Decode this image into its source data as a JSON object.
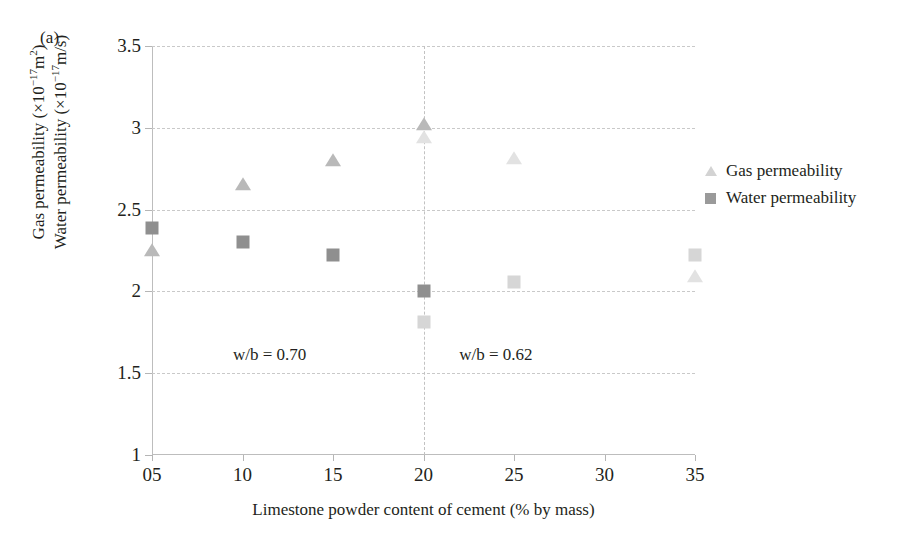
{
  "figure": {
    "panel_label": "(a)"
  },
  "axes": {
    "y_title_line1_prefix": "Gas permeability (×10",
    "y_title_line1_exp": "−17",
    "y_title_line1_suffix": "m",
    "y_title_line1_unit_exp": "2",
    "y_title_line1_close": ")",
    "y_title_line2_prefix": "Water permeability (×10",
    "y_title_line2_exp": "−17",
    "y_title_line2_suffix": "m/s)",
    "x_title": "Limestone powder content of cement (% by mass)",
    "y_ticklabels": [
      "1",
      "1.5",
      "2",
      "2.5",
      "3",
      "3.5"
    ],
    "x_ticklabels": [
      "05",
      "10",
      "15",
      "20",
      "25",
      "30",
      "35"
    ]
  },
  "legend": {
    "items": [
      {
        "label": "Gas permeability",
        "marker": "triangle-icon",
        "color": "#d3d3d3"
      },
      {
        "label": "Water permeability",
        "marker": "square-icon",
        "color": "#9a9a9a"
      }
    ]
  },
  "annotations": [
    {
      "text": "w/b = 0.70",
      "x": 11.5,
      "y": 1.6
    },
    {
      "text": "w/b = 0.62",
      "x": 24.0,
      "y": 1.6
    }
  ],
  "colors": {
    "gas_dark": "#b9b9b9",
    "gas_light": "#e2e2e2",
    "water_dark": "#8f8f8f",
    "water_light": "#d6d6d6",
    "grid": "#c9c9c9",
    "axis": "#bdbdbd",
    "text": "#231f20"
  },
  "chart_data": {
    "type": "scatter",
    "title": "",
    "xlabel": "Limestone powder content of cement (% by mass)",
    "ylabel": "Gas permeability (×10⁻¹⁷ m²) / Water permeability (×10⁻¹⁷ m/s)",
    "xlim": [
      5,
      35
    ],
    "ylim": [
      1,
      3.5
    ],
    "yticks": [
      1,
      1.5,
      2,
      2.5,
      3,
      3.5
    ],
    "xticks": [
      5,
      10,
      15,
      20,
      25,
      30,
      35
    ],
    "grid": "horizontal-dashed",
    "legend_position": "right",
    "vertical_divider_x": 20,
    "series": [
      {
        "name": "Gas permeability",
        "group": "w/b = 0.70",
        "marker": "triangle",
        "color": "#b9b9b9",
        "points": [
          {
            "x": 5,
            "y": 2.25
          },
          {
            "x": 10,
            "y": 2.65
          },
          {
            "x": 15,
            "y": 2.8
          },
          {
            "x": 20,
            "y": 3.02
          }
        ]
      },
      {
        "name": "Water permeability",
        "group": "w/b = 0.70",
        "marker": "square",
        "color": "#8f8f8f",
        "points": [
          {
            "x": 5,
            "y": 2.39
          },
          {
            "x": 10,
            "y": 2.3
          },
          {
            "x": 15,
            "y": 2.22
          },
          {
            "x": 20,
            "y": 2.0
          }
        ]
      },
      {
        "name": "Gas permeability",
        "group": "w/b = 0.62",
        "marker": "triangle",
        "color": "#e2e2e2",
        "points": [
          {
            "x": 20,
            "y": 2.94
          },
          {
            "x": 25,
            "y": 2.81
          },
          {
            "x": 35,
            "y": 2.09
          }
        ]
      },
      {
        "name": "Water permeability",
        "group": "w/b = 0.62",
        "marker": "square",
        "color": "#d6d6d6",
        "points": [
          {
            "x": 20,
            "y": 1.81
          },
          {
            "x": 25,
            "y": 2.06
          },
          {
            "x": 35,
            "y": 2.22
          }
        ]
      }
    ]
  }
}
